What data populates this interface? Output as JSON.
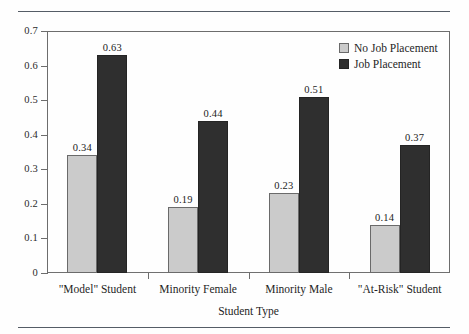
{
  "figure": {
    "background_color": "#fefefe",
    "rule_color": "#555d66",
    "frame_color": "#6d6d6d"
  },
  "chart_data": {
    "type": "bar",
    "title": "",
    "subtitle": "",
    "xlabel": "Student Type",
    "ylabel": "",
    "categories": [
      "\"Model\" Student",
      "Minority Female",
      "Minority Male",
      "\"At-Risk\" Student"
    ],
    "series": [
      {
        "name": "No Job Placement",
        "color": "#cbcbcb",
        "values": [
          0.34,
          0.19,
          0.23,
          0.14
        ],
        "labels": [
          "0.34",
          "0.19",
          "0.23",
          "0.14"
        ]
      },
      {
        "name": "Job Placement",
        "color": "#2f2f2f",
        "values": [
          0.63,
          0.44,
          0.51,
          0.37
        ],
        "labels": [
          "0.63",
          "0.44",
          "0.51",
          "0.37"
        ]
      }
    ],
    "ylim": [
      0,
      0.7
    ],
    "yticks": [
      0,
      0.1,
      0.2,
      0.3,
      0.4,
      0.5,
      0.6,
      0.7
    ],
    "ytick_labels": [
      "0",
      "0.1",
      "0.2",
      "0.3",
      "0.4",
      "0.5",
      "0.6",
      "0.7"
    ],
    "grid": false,
    "legend_position": "top-right",
    "legend_entries": [
      "No Job Placement",
      "Job Placement"
    ]
  }
}
